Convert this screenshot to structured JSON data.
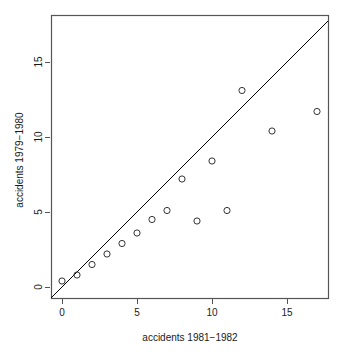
{
  "chart_data": {
    "type": "scatter",
    "title": "",
    "xlabel": "accidents 1981−1982",
    "ylabel": "accidents 1979−1980",
    "xlim": [
      -0.8,
      17.8
    ],
    "ylim": [
      -0.8,
      17.8
    ],
    "xticks": [
      0,
      5,
      10,
      15
    ],
    "xtick_labels": [
      "0",
      "5",
      "10",
      "15"
    ],
    "yticks": [
      0,
      5,
      10,
      15
    ],
    "ytick_labels": [
      "0",
      "5",
      "10",
      "15"
    ],
    "grid": false,
    "legend": null,
    "marker": "open-circle",
    "marker_color": "#333333",
    "point_color": "#333333",
    "line_color": "#000000",
    "box_color": "#555555",
    "x": [
      0,
      1,
      2,
      3,
      4,
      5,
      6,
      7,
      8,
      9,
      10,
      11,
      12,
      14,
      17
    ],
    "y": [
      0.4,
      0.8,
      1.5,
      2.2,
      2.9,
      3.6,
      4.5,
      5.1,
      7.2,
      4.4,
      8.4,
      5.1,
      13.1,
      10.4,
      11.7
    ],
    "points": [
      {
        "x": 0,
        "y": 0.4
      },
      {
        "x": 1,
        "y": 0.8
      },
      {
        "x": 2,
        "y": 1.5
      },
      {
        "x": 3,
        "y": 2.2
      },
      {
        "x": 4,
        "y": 2.9
      },
      {
        "x": 5,
        "y": 3.6
      },
      {
        "x": 6,
        "y": 4.5
      },
      {
        "x": 7,
        "y": 5.1
      },
      {
        "x": 8,
        "y": 7.2
      },
      {
        "x": 9,
        "y": 4.4
      },
      {
        "x": 10,
        "y": 8.4
      },
      {
        "x": 11,
        "y": 5.1
      },
      {
        "x": 12,
        "y": 13.1
      },
      {
        "x": 14,
        "y": 10.4
      },
      {
        "x": 17,
        "y": 11.7
      }
    ],
    "reference_line": {
      "name": "identity-line",
      "type": "abline",
      "slope": 1,
      "intercept": 0,
      "x_start": -0.8,
      "x_end": 17.8
    }
  }
}
